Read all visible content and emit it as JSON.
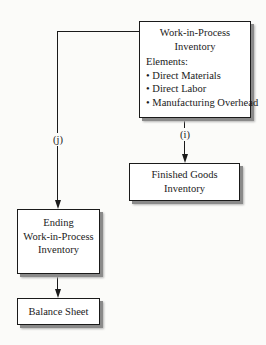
{
  "diagram": {
    "wip_box": {
      "title_line1": "Work-in-Process",
      "title_line2": "Inventory",
      "elements_heading": "Elements:",
      "elements": [
        "• Direct Materials",
        "• Direct Labor",
        "• Manufacturing Overhead"
      ]
    },
    "finished_goods_box": {
      "line1": "Finished Goods",
      "line2": "Inventory"
    },
    "ending_wip_box": {
      "line1": "Ending",
      "line2": "Work-in-Process",
      "line3": "Inventory"
    },
    "balance_sheet_box": {
      "label": "Balance Sheet"
    },
    "edges": [
      {
        "from": "wip_box",
        "to": "finished_goods_box",
        "label": "(i)"
      },
      {
        "from": "wip_box",
        "to": "ending_wip_box",
        "label": "(j)"
      },
      {
        "from": "ending_wip_box",
        "to": "balance_sheet_box",
        "label": ""
      }
    ]
  }
}
